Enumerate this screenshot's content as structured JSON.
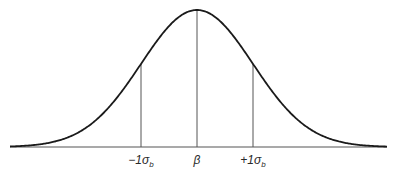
{
  "diagram": {
    "type": "normal-distribution",
    "curve_color": "#1a1a1a",
    "line_color": "#555555",
    "geometry": {
      "baseline_y": 147,
      "x_start": 10,
      "x_end": 387,
      "center_x": 197,
      "sigma_px": 56,
      "peak_y": 10
    },
    "markers": [
      {
        "id": "minus-one-sigma",
        "offset_sigma": -1,
        "label_main": "−1σ",
        "label_sub": "b"
      },
      {
        "id": "mean",
        "offset_sigma": 0,
        "label_main": "β",
        "label_sub": ""
      },
      {
        "id": "plus-one-sigma",
        "offset_sigma": 1,
        "label_main": "+1σ",
        "label_sub": "b"
      }
    ]
  }
}
